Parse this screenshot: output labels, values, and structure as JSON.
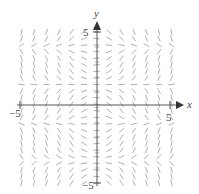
{
  "chart_data": {
    "type": "direction_field",
    "title": "",
    "xlabel": "x",
    "ylabel": "y",
    "xlim": [
      -5,
      5
    ],
    "ylim": [
      -5,
      5
    ],
    "x_ticks": [
      -5,
      5
    ],
    "y_ticks": [
      5,
      -5
    ],
    "tick_labels": {
      "x_neg": "−5",
      "x_pos": "5",
      "y_pos": "5",
      "y_neg": "−5"
    },
    "grid": false,
    "field_description": "slope field dy/dx = f(x,y); arrows converge horizontally toward bands near y≈1.5, y≈-2.5 and diverge near y≈3.5, y≈-0.5, y≈-4.5",
    "grid_columns": 13,
    "grid_rows": 24,
    "colors": {
      "axis": "#555555",
      "segment": "#9a9a9a",
      "text": "#444444"
    }
  },
  "labels": {
    "x": "x",
    "y": "y",
    "x_neg": "−5",
    "x_pos": "5",
    "y_pos": "5",
    "y_neg": "−5"
  }
}
